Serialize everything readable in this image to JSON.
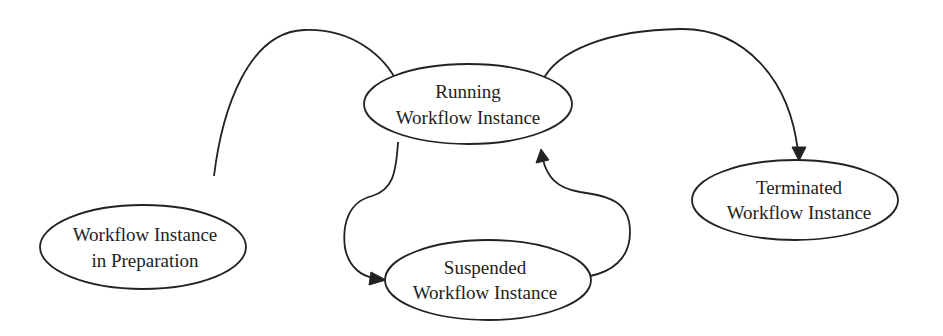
{
  "diagram": {
    "type": "state-transition",
    "nodes": [
      {
        "id": "preparation",
        "line1": "Workflow Instance",
        "line2": "in Preparation"
      },
      {
        "id": "running",
        "line1": "Running",
        "line2": "Workflow Instance"
      },
      {
        "id": "suspended",
        "line1": "Suspended",
        "line2": "Workflow Instance"
      },
      {
        "id": "terminated",
        "line1": "Terminated",
        "line2": "Workflow Instance"
      }
    ],
    "edges": [
      {
        "from": "preparation",
        "to": "running"
      },
      {
        "from": "running",
        "to": "suspended"
      },
      {
        "from": "suspended",
        "to": "running"
      },
      {
        "from": "running",
        "to": "terminated"
      }
    ],
    "colors": {
      "stroke": "#222222",
      "background": "#ffffff"
    }
  }
}
